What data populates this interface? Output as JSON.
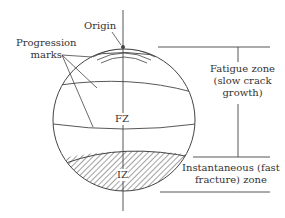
{
  "labels": {
    "origin": "Origin",
    "progression_marks_1": "Progression",
    "progression_marks_2": "marks",
    "fatigue_zone_1": "Fatigue zone",
    "fatigue_zone_2": "(slow crack",
    "fatigue_zone_3": "growth)",
    "fz": "FZ",
    "iz": "IZ",
    "instantaneous_1": "Instantaneous (fast",
    "instantaneous_2": "fracture) zone"
  },
  "colors": {
    "line": "#444444",
    "text": "#333333",
    "background": "#ffffff"
  }
}
